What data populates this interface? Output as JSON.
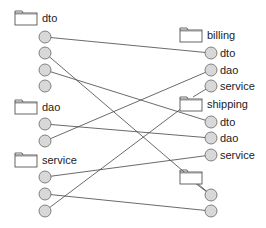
{
  "colors": {
    "line": "#444444",
    "circle_fill": "#d8d8d8",
    "circle_stroke": "#666666",
    "folder_stroke": "#555555"
  },
  "left": {
    "groups": [
      {
        "name": "dto",
        "folder": {
          "x": 15,
          "y": 11
        },
        "label": "dto",
        "nodes": [
          {
            "y": 37
          },
          {
            "y": 53
          },
          {
            "y": 70
          },
          {
            "y": 86
          }
        ]
      },
      {
        "name": "dao",
        "folder": {
          "x": 15,
          "y": 100
        },
        "label": "dao",
        "nodes": [
          {
            "y": 124
          },
          {
            "y": 141
          }
        ]
      },
      {
        "name": "service",
        "folder": {
          "x": 15,
          "y": 153
        },
        "label": "service",
        "nodes": [
          {
            "y": 177
          },
          {
            "y": 194
          },
          {
            "y": 211
          }
        ]
      }
    ]
  },
  "right": {
    "groups": [
      {
        "name": "billing",
        "folder": {
          "x": 180,
          "y": 28
        },
        "label": "billing",
        "nodes": [
          {
            "y": 53,
            "label": "dto"
          },
          {
            "y": 70,
            "label": "dao"
          },
          {
            "y": 86,
            "label": "service"
          }
        ]
      },
      {
        "name": "shipping",
        "folder": {
          "x": 180,
          "y": 97
        },
        "label": "shipping",
        "nodes": [
          {
            "y": 122,
            "label": "dto"
          },
          {
            "y": 138,
            "label": "dao"
          },
          {
            "y": 155,
            "label": "service"
          }
        ]
      },
      {
        "name": "unnamed",
        "folder": {
          "x": 180,
          "y": 170
        },
        "label": "",
        "nodes": [
          {
            "y": 195,
            "label": ""
          },
          {
            "y": 211,
            "label": ""
          }
        ]
      }
    ]
  },
  "edges": [
    {
      "from": [
        45,
        37
      ],
      "to": [
        211,
        53
      ]
    },
    {
      "from": [
        45,
        53
      ],
      "to": [
        211,
        195
      ]
    },
    {
      "from": [
        45,
        70
      ],
      "to": [
        211,
        122
      ]
    },
    {
      "from": [
        45,
        124
      ],
      "to": [
        211,
        138
      ]
    },
    {
      "from": [
        45,
        141
      ],
      "to": [
        211,
        70
      ]
    },
    {
      "from": [
        45,
        177
      ],
      "to": [
        211,
        155
      ]
    },
    {
      "from": [
        45,
        194
      ],
      "to": [
        211,
        211
      ]
    },
    {
      "from": [
        45,
        211
      ],
      "to": [
        182,
        108
      ]
    },
    {
      "from": [
        211,
        86
      ],
      "to": [
        193,
        97
      ]
    },
    {
      "from": [
        195,
        183
      ],
      "to": [
        211,
        195
      ]
    }
  ]
}
